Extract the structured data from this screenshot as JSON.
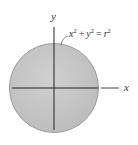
{
  "diagram": {
    "type": "circle-area-figure",
    "axes": {
      "x_label": "x",
      "y_label": "y"
    },
    "equation": {
      "base_x": "x",
      "exp_x": "2",
      "plus": "+",
      "base_y": "y",
      "exp_y": "2",
      "equals": "=",
      "base_r": "r",
      "exp_r": "2",
      "full_text": "x² + y² = r²"
    },
    "colors": {
      "fill": "#c9c9c9",
      "fill_dark": "#b9b9b9",
      "outline": "#9a9a9a",
      "axis": "#222222",
      "text": "#333333"
    }
  }
}
